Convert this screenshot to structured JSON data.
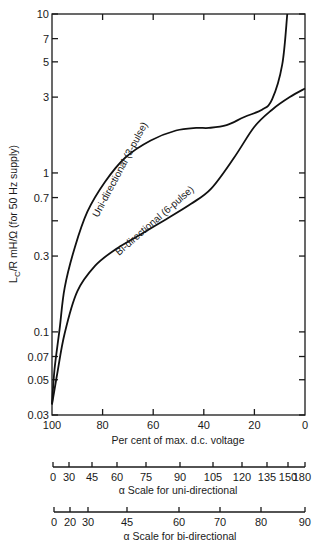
{
  "chart_data": {
    "type": "line",
    "title": "",
    "xlabel": "Per cent of max. d.c. voltage",
    "ylabel": "L_C/R mH/Ω (for 50 Hz supply)",
    "x_reversed": true,
    "xlim": [
      100,
      0
    ],
    "ylim": [
      0.03,
      10
    ],
    "y_scale": "log",
    "x_ticks": [
      100,
      80,
      60,
      40,
      20,
      0
    ],
    "y_ticks": [
      0.03,
      0.05,
      0.07,
      0.1,
      0.3,
      0.7,
      1,
      3,
      5,
      7,
      10
    ],
    "y_tick_labels": [
      "0.03",
      "0.05",
      "0.07",
      "0.1",
      "0.3",
      "0.7",
      "1",
      "3",
      "5",
      "7",
      "10"
    ],
    "grid": false,
    "series": [
      {
        "name": "Uni-directional (3-pulse)",
        "x": [
          100,
          99,
          97,
          95,
          91,
          86,
          79,
          71,
          61,
          51,
          43,
          38,
          31,
          24,
          17,
          13,
          9,
          7
        ],
        "y": [
          0.035,
          0.058,
          0.104,
          0.19,
          0.34,
          0.57,
          0.88,
          1.25,
          1.6,
          1.85,
          1.92,
          1.92,
          2.0,
          2.25,
          2.5,
          2.9,
          4.8,
          10
        ]
      },
      {
        "name": "Bi-directional (6-pulse)",
        "x": [
          100,
          98,
          95,
          90,
          83,
          75,
          65,
          55,
          45,
          37,
          28,
          20,
          13,
          6,
          0
        ],
        "y": [
          0.035,
          0.054,
          0.098,
          0.18,
          0.26,
          0.33,
          0.41,
          0.51,
          0.64,
          0.8,
          1.25,
          1.95,
          2.5,
          3.0,
          3.4
        ]
      }
    ],
    "secondary_axes": [
      {
        "label": "α Scale for uni-directional",
        "ticks": [
          0,
          30,
          45,
          60,
          75,
          90,
          105,
          120,
          135,
          150,
          180
        ]
      },
      {
        "label": "α Scale for bi-directional",
        "ticks": [
          0,
          20,
          30,
          45,
          60,
          70,
          80,
          90
        ]
      }
    ]
  },
  "labels": {
    "ylabel_main": "L",
    "ylabel_sub": "C",
    "ylabel_rest": "/R mH/Ω (for 50 Hz supply)",
    "xlabel": "Per cent of max. d.c. voltage",
    "uni_scale": "α Scale for uni-directional",
    "bi_scale": "α Scale for bi-directional",
    "curve_uni": "Uni-directional (3-pulse)",
    "curve_bi": "Bi-directional (6-pulse)"
  }
}
